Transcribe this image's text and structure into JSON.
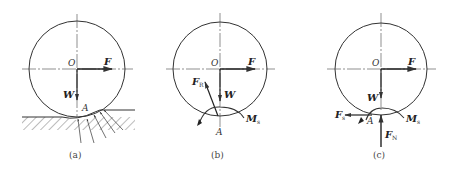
{
  "colors": {
    "ink": "#333333",
    "background": "#ffffff"
  },
  "panels": [
    {
      "id": "a",
      "caption": "(a)",
      "labels": {
        "center": "O",
        "force": "F",
        "weight": "W",
        "contact": "A"
      },
      "description": "Wheel on deformable ground with distributed contact forces"
    },
    {
      "id": "b",
      "caption": "(b)",
      "labels": {
        "center": "O",
        "force": "F",
        "weight": "W",
        "contact": "A",
        "resultant": "F",
        "resultant_sub": "R",
        "moment": "M",
        "moment_sub": "s"
      },
      "description": "Resultant reaction force and moment at contact point"
    },
    {
      "id": "c",
      "caption": "(c)",
      "labels": {
        "center": "O",
        "force": "F",
        "weight": "W",
        "contact": "A",
        "friction": "F",
        "friction_sub": "s",
        "normal": "F",
        "normal_sub": "N",
        "moment": "M",
        "moment_sub": "s"
      },
      "description": "Resultant decomposed into friction, normal force and rolling resistance moment"
    }
  ]
}
